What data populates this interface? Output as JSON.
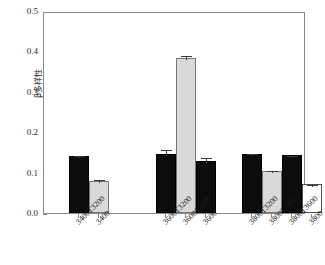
{
  "chart_data": {
    "type": "bar",
    "title": "",
    "xlabel": "",
    "ylabel": "β多样性",
    "ylim": [
      0.0,
      0.5
    ],
    "yticks": [
      "0.0",
      "0.1",
      "0.2",
      "0.3",
      "0.4",
      "0.5"
    ],
    "ytick_values": [
      0.0,
      0.1,
      0.2,
      0.3,
      0.4,
      0.5
    ],
    "grid": false,
    "legend": "none",
    "groups": [
      {
        "name": "group-3400",
        "bars": [
          {
            "label": "3400T3200",
            "value": 0.141,
            "error": 0.004,
            "fill": "black"
          },
          {
            "label": "3400",
            "value": 0.08,
            "error": 0.006,
            "fill": "gray"
          }
        ]
      },
      {
        "name": "group-3600",
        "bars": [
          {
            "label": "3600T3200",
            "value": 0.147,
            "error": 0.013,
            "fill": "black"
          },
          {
            "label": "3600T3400",
            "value": 0.383,
            "error": 0.011,
            "fill": "gray"
          },
          {
            "label": "3600",
            "value": 0.128,
            "error": 0.013,
            "fill": "black"
          }
        ]
      },
      {
        "name": "group-3800",
        "bars": [
          {
            "label": "3800T3200",
            "value": 0.147,
            "error": 0.003,
            "fill": "black"
          },
          {
            "label": "3800T3400",
            "value": 0.105,
            "error": 0.003,
            "fill": "gray"
          },
          {
            "label": "3800T3600",
            "value": 0.143,
            "error": 0.003,
            "fill": "black"
          },
          {
            "label": "3800",
            "value": 0.071,
            "error": 0.004,
            "fill": "white"
          }
        ]
      }
    ]
  }
}
